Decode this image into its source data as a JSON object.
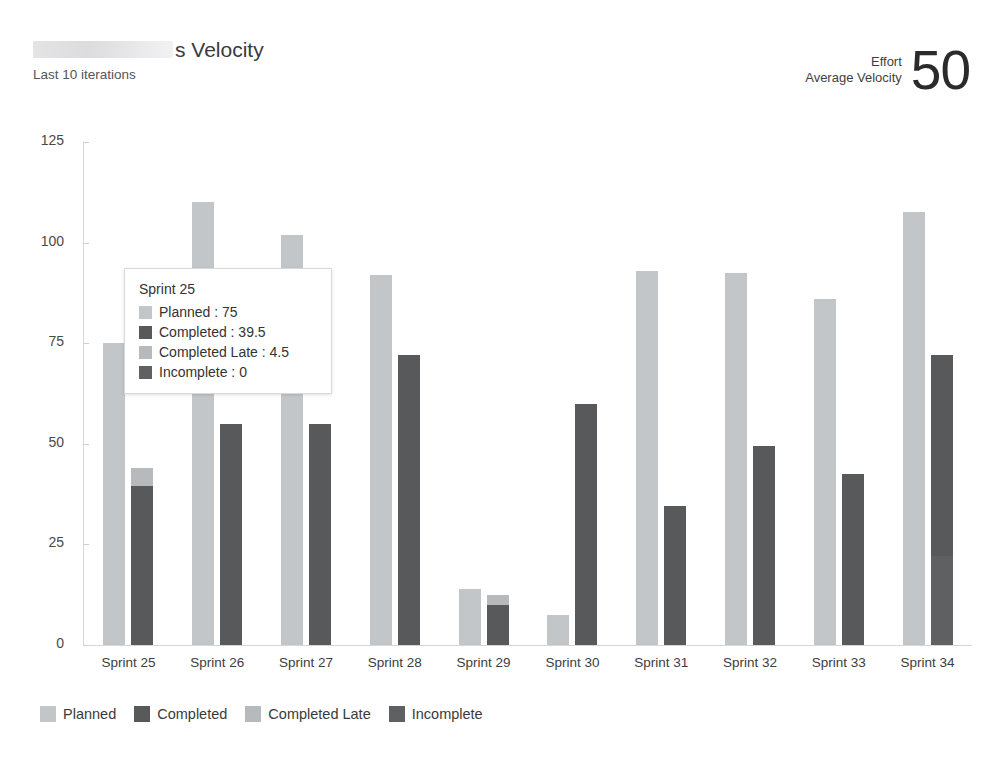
{
  "header": {
    "ghost_strip_text": "",
    "title_prefix_redacted": true,
    "title_suffix": "s Velocity",
    "subtitle": "Last 10 iterations"
  },
  "kpi": {
    "label_top": "Effort",
    "label_bottom": "Average Velocity",
    "value": "50"
  },
  "colors": {
    "planned": "#c3c6c8",
    "completed": "#57595b",
    "completed_late": "#b7babc",
    "incomplete": "#5e6062",
    "axis": "#d6d6d6",
    "text": "#3a3a3a"
  },
  "legend": {
    "items": [
      {
        "label": "Planned",
        "color": "#c3c6c8"
      },
      {
        "label": "Completed",
        "color": "#57595b"
      },
      {
        "label": "Completed Late",
        "color": "#b7babc"
      },
      {
        "label": "Incomplete",
        "color": "#5e6062"
      }
    ]
  },
  "tooltip": {
    "title": "Sprint 25",
    "rows": [
      {
        "label": "Planned : 75",
        "color": "#c3c6c8"
      },
      {
        "label": "Completed : 39.5",
        "color": "#57595b"
      },
      {
        "label": "Completed Late : 4.5",
        "color": "#b7babc"
      },
      {
        "label": "Incomplete : 0",
        "color": "#5e6062"
      }
    ]
  },
  "chart_data": {
    "type": "bar",
    "title": "s Velocity",
    "subtitle": "Last 10 iterations",
    "xlabel": "",
    "ylabel": "",
    "ylim": [
      0,
      125
    ],
    "yticks": [
      0,
      25,
      50,
      75,
      100,
      125
    ],
    "grid": false,
    "legend_position": "bottom-left",
    "layout": "grouped-with-stacked-actuals",
    "categories": [
      "Sprint 25",
      "Sprint 26",
      "Sprint 27",
      "Sprint 28",
      "Sprint 29",
      "Sprint 30",
      "Sprint 31",
      "Sprint 32",
      "Sprint 33",
      "Sprint 34"
    ],
    "series": [
      {
        "name": "Planned",
        "color": "#c3c6c8",
        "values": [
          75,
          110,
          102,
          92,
          14,
          7.5,
          93,
          92.5,
          86,
          107.5
        ]
      },
      {
        "name": "Completed",
        "color": "#57595b",
        "values": [
          39.5,
          55,
          55,
          72,
          10,
          60,
          34.5,
          49.5,
          42.5,
          50
        ]
      },
      {
        "name": "Completed Late",
        "color": "#b7babc",
        "values": [
          4.5,
          0,
          0,
          0,
          2.5,
          0,
          0,
          0,
          0,
          0
        ]
      },
      {
        "name": "Incomplete",
        "color": "#5e6062",
        "values": [
          0,
          0,
          0,
          0,
          0,
          0,
          0,
          0,
          0,
          22
        ]
      }
    ]
  },
  "axis": {
    "y_ticks": [
      "125",
      "100",
      "75",
      "50",
      "25",
      "0"
    ]
  },
  "x_labels": [
    "Sprint 25",
    "Sprint 26",
    "Sprint 27",
    "Sprint 28",
    "Sprint 29",
    "Sprint 30",
    "Sprint 31",
    "Sprint 32",
    "Sprint 33",
    "Sprint 34"
  ]
}
